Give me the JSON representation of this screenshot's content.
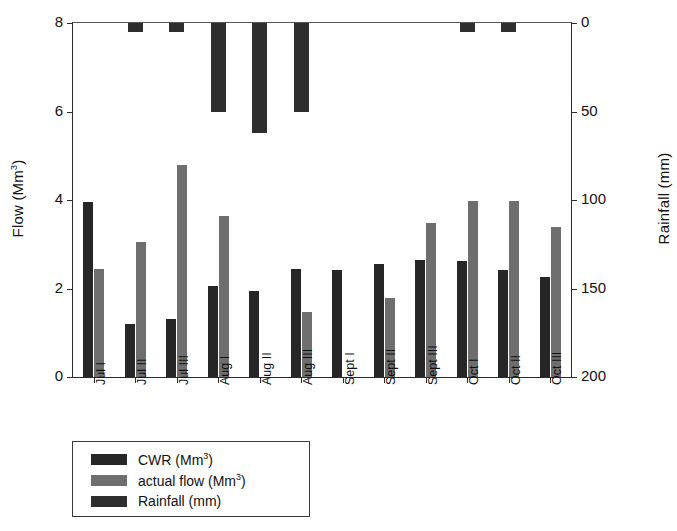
{
  "chart_data": {
    "type": "bar",
    "title": "",
    "xlabel": "",
    "ylabel": "Flow (Mm3)",
    "ylabel_left": "Flow (Mm",
    "ylabel_left_sup": "3",
    "ylabel_left_tail": ")",
    "ylabel_right": "Rainfall (mm)",
    "categories": [
      "Jul I",
      "Jul II",
      "Jul III",
      "Aug I",
      "Aug II",
      "Aug III",
      "Sept I",
      "Sept II",
      "Sept III",
      "Oct I",
      "Oct II",
      "Oct III"
    ],
    "series": [
      {
        "name": "CWR (Mm3)",
        "axis": "left",
        "color": "#262626",
        "values": [
          3.95,
          1.2,
          1.3,
          2.05,
          1.95,
          2.45,
          2.42,
          2.55,
          2.65,
          2.62,
          2.42,
          2.25
        ]
      },
      {
        "name": "actual flow (Mm3)",
        "axis": "left",
        "color": "#6e6e6e",
        "values": [
          2.45,
          3.05,
          4.8,
          3.65,
          0,
          1.48,
          0,
          1.78,
          3.47,
          3.98,
          3.97,
          3.38
        ]
      },
      {
        "name": "Rainfall (mm)",
        "axis": "right",
        "color": "#2e2e2e",
        "values": [
          0,
          5,
          5,
          50,
          62,
          50,
          0,
          0,
          0,
          5,
          5,
          0
        ]
      }
    ],
    "ylim_left": [
      0,
      8
    ],
    "yticks_left": [
      0,
      2,
      4,
      6,
      8
    ],
    "ylim_right": [
      0,
      200
    ],
    "yticks_right": [
      0,
      50,
      100,
      150,
      200
    ],
    "right_axis_inverted": true,
    "grid": false,
    "legend_position": "below-left"
  },
  "axes": {
    "left": {
      "title_main": "Flow (Mm",
      "title_sup": "3",
      "title_tail": ")",
      "ticks": [
        "8",
        "6",
        "4",
        "2",
        "0"
      ]
    },
    "right": {
      "title": "Rainfall (mm)",
      "ticks": [
        "0",
        "50",
        "100",
        "150",
        "200"
      ]
    },
    "x": {
      "labels": [
        "Jul I",
        "Jul II",
        "Jul III",
        "Aug I",
        "Aug II",
        "Aug III",
        "Sept I",
        "Sept II",
        "Sept III",
        "Oct I",
        "Oct II",
        "Oct III"
      ]
    }
  },
  "legend": {
    "items": [
      {
        "label_main": "CWR (Mm",
        "label_sup": "3",
        "label_tail": ")",
        "swatch": "cwr"
      },
      {
        "label_main": "actual flow (Mm",
        "label_sup": "3",
        "label_tail": ")",
        "swatch": "flow"
      },
      {
        "label_main": "Rainfall (mm)",
        "label_sup": "",
        "label_tail": "",
        "swatch": "rainfall"
      }
    ]
  }
}
